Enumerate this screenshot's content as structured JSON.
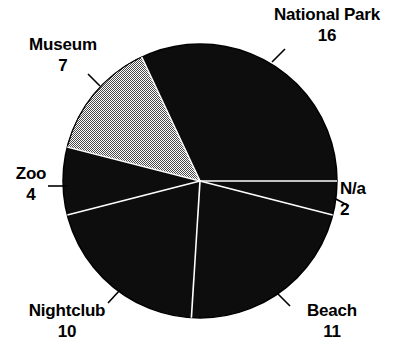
{
  "chart_data": {
    "type": "pie",
    "title": "",
    "subtitle": "",
    "xlabel": "",
    "ylabel": "",
    "legend_position": "none",
    "grid": false,
    "total": 50,
    "start_angle_deg": 0,
    "direction": "clockwise",
    "categories": [
      "N/a",
      "Beach",
      "Nightclub",
      "Zoo",
      "Museum",
      "National Park"
    ],
    "values": [
      2,
      11,
      10,
      4,
      7,
      16
    ],
    "slices": [
      {
        "label": "N/a",
        "value": "2",
        "numeric": 2,
        "percent": 4,
        "fill": "black",
        "color": "#000000",
        "start_deg": 0,
        "end_deg": 14.4,
        "label_position": "right"
      },
      {
        "label": "Beach",
        "value": "11",
        "numeric": 11,
        "percent": 22,
        "fill": "black",
        "color": "#000000",
        "start_deg": 14.4,
        "end_deg": 93.6,
        "label_position": "bottom-right"
      },
      {
        "label": "Nightclub",
        "value": "10",
        "numeric": 10,
        "percent": 20,
        "fill": "black",
        "color": "#000000",
        "start_deg": 93.6,
        "end_deg": 165.6,
        "label_position": "bottom-left"
      },
      {
        "label": "Zoo",
        "value": "4",
        "numeric": 4,
        "percent": 8,
        "fill": "black",
        "color": "#000000",
        "start_deg": 165.6,
        "end_deg": 194.4,
        "label_position": "left"
      },
      {
        "label": "Museum",
        "value": "7",
        "numeric": 7,
        "percent": 14,
        "fill": "halftone-gray",
        "color": "#b4b4b4",
        "start_deg": 194.4,
        "end_deg": 244.8,
        "label_position": "top-left"
      },
      {
        "label": "National Park",
        "value": "16",
        "numeric": 16,
        "percent": 32,
        "fill": "black",
        "color": "#000000",
        "start_deg": 244.8,
        "end_deg": 360,
        "label_position": "top-right"
      }
    ]
  },
  "geometry": {
    "center_x": 200,
    "center_y": 181,
    "radius": 137,
    "outline_color": "#000000",
    "separator_color": "#ffffff",
    "background": "#ffffff"
  },
  "labels": {
    "national_park": {
      "name": "National Park",
      "value": "16"
    },
    "museum": {
      "name": "Museum",
      "value": "7"
    },
    "zoo": {
      "name": "Zoo",
      "value": "4"
    },
    "na": {
      "name": "N/a",
      "value": "2"
    },
    "nightclub": {
      "name": "Nightclub",
      "value": "10"
    },
    "beach": {
      "name": "Beach",
      "value": "11"
    }
  }
}
